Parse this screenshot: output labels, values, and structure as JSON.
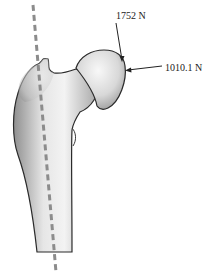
{
  "diagram": {
    "forces": [
      {
        "label": "1752 N",
        "direction": "downward onto femoral head"
      },
      {
        "label": "1010.1 N",
        "direction": "leftward onto femoral head"
      }
    ],
    "axis_line": {
      "style": "dashed",
      "color": "#8c8c8c"
    },
    "colors": {
      "bone_fill_light": "#f2f2f2",
      "bone_fill_dark": "#9a9a9a",
      "outline": "#2a2a2a",
      "arrow": "#222222"
    }
  }
}
